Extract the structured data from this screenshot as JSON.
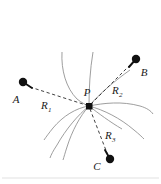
{
  "figure": {
    "type": "vector-diagram",
    "background_color": "#ffffff",
    "curve_color": "#8d8d8d",
    "marker_color": "#111111",
    "dash_color": "#2b2b2b",
    "width": 161,
    "height": 184
  },
  "labels": {
    "point_p": "P",
    "point_a": "A",
    "point_b": "B",
    "point_c": "C",
    "r1_base": "R",
    "r1_sub": "1",
    "r2_base": "R",
    "r2_sub": "2",
    "r3_base": "R",
    "r3_sub": "3"
  },
  "points": {
    "p": {
      "x": 89,
      "y": 106,
      "marker": "square",
      "size": 6
    },
    "a": {
      "x": 23,
      "y": 82,
      "marker": "circle",
      "radius": 4.2
    },
    "b": {
      "x": 136,
      "y": 59,
      "marker": "circle",
      "radius": 4.2
    },
    "c": {
      "x": 110,
      "y": 159,
      "marker": "circle",
      "radius": 4.2
    }
  },
  "vectors": [
    {
      "name": "R1",
      "from": "A",
      "to": "P",
      "style": "dashed",
      "label_x": 44,
      "label_y": 106
    },
    {
      "name": "R2",
      "from": "P",
      "to": "B",
      "style": "dashed",
      "label_x": 114,
      "label_y": 92
    },
    {
      "name": "R3",
      "from": "P",
      "to": "C",
      "style": "dashed",
      "label_x": 107,
      "label_y": 137
    }
  ],
  "field_lines": {
    "count": 9,
    "converge_at": "P"
  }
}
